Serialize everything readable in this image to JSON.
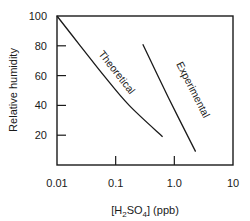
{
  "chart_data": {
    "type": "line",
    "title": "",
    "xlabel": "[H2SO4] (ppb)",
    "xlabel_parts": {
      "pre": "[H",
      "sub1": "2",
      "mid": "SO",
      "sub2": "4",
      "post": "] (ppb)"
    },
    "ylabel": "Relative humidity",
    "x_scale": "log",
    "xlim": [
      0.01,
      10
    ],
    "ylim": [
      0,
      100
    ],
    "x_ticks": [
      0.01,
      0.1,
      1.0,
      10
    ],
    "x_tick_labels": [
      "0.01",
      "0.1",
      "1.0",
      "10"
    ],
    "y_ticks": [
      20,
      40,
      60,
      80,
      100
    ],
    "y_tick_labels": [
      "20",
      "40",
      "60",
      "80",
      "100"
    ],
    "grid": false,
    "legend": "none (curves labeled inline)",
    "series": [
      {
        "name": "Theoretical",
        "x": [
          0.01,
          0.025,
          0.063,
          0.17,
          0.63
        ],
        "y": [
          100,
          80,
          60,
          40,
          19
        ]
      },
      {
        "name": "Experimental",
        "x": [
          0.29,
          0.8,
          2.3
        ],
        "y": [
          81,
          45,
          9
        ]
      }
    ]
  }
}
